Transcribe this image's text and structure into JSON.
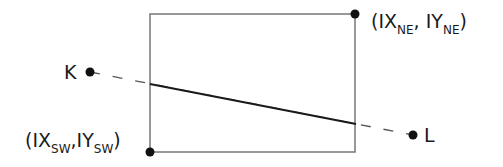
{
  "diagram": {
    "rectangle": {
      "sw_corner": {
        "x": 150,
        "y": 152
      },
      "ne_corner": {
        "x": 355,
        "y": 14
      },
      "stroke_color": "#777777"
    },
    "points": {
      "K": {
        "label": "K",
        "x": 90,
        "y": 72
      },
      "L": {
        "label": "L",
        "x": 413,
        "y": 135
      }
    },
    "corner_labels": {
      "ne": {
        "open": "(IX",
        "sub1": "NE",
        "mid": ", IY",
        "sub2": "NE",
        "close": ")"
      },
      "sw": {
        "open": "(IX",
        "sub1": "SW",
        "mid": ",IY",
        "sub2": "SW",
        "close": ")"
      }
    },
    "clipped_segment": {
      "x1": 150,
      "y1": 84,
      "x2": 356,
      "y2": 124,
      "stroke_color": "#1a1a1a"
    },
    "dashed_segment_color": "#555555"
  }
}
